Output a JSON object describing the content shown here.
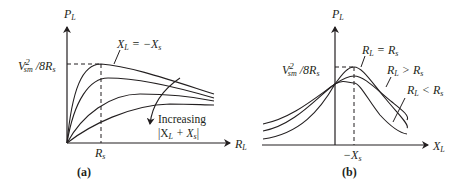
{
  "panel_a": {
    "caption": "(a)",
    "y_axis": {
      "label_main": "P",
      "label_sub": "L"
    },
    "x_axis": {
      "label_main": "R",
      "label_sub": "L"
    },
    "max_label": {
      "v": "V",
      "v_sub": "sm",
      "v_sup": "2",
      "rest": "/8R",
      "rest_sub": "s"
    },
    "x_tick": {
      "main": "R",
      "sub": "s"
    },
    "curve_label": {
      "lhs": "X",
      "lhs_sub": "L",
      "eq": " = −X",
      "rhs_sub": "s"
    },
    "arrow_note": {
      "line1": "Increasing",
      "line2_pre": "|X",
      "line2_sub1": "L",
      "line2_mid": " + X",
      "line2_sub2": "s",
      "line2_post": "|"
    }
  },
  "panel_b": {
    "caption": "(b)",
    "y_axis": {
      "label_main": "P",
      "label_sub": "L"
    },
    "x_axis": {
      "label_main": "X",
      "label_sub": "L"
    },
    "max_label": {
      "v": "V",
      "v_sub": "sm",
      "v_sup": "2",
      "rest": "/8R",
      "rest_sub": "s"
    },
    "x_tick": {
      "main": "−X",
      "sub": "s"
    },
    "curve_labels": [
      {
        "lhs": "R",
        "lhs_sub": "L",
        "op": " = R",
        "rhs_sub": "s"
      },
      {
        "lhs": "R",
        "lhs_sub": "L",
        "op": " > R",
        "rhs_sub": "s"
      },
      {
        "lhs": "R",
        "lhs_sub": "L",
        "op": " < R",
        "rhs_sub": "s"
      }
    ]
  },
  "colors": {
    "ink": "#231f20",
    "background": "#ffffff"
  }
}
